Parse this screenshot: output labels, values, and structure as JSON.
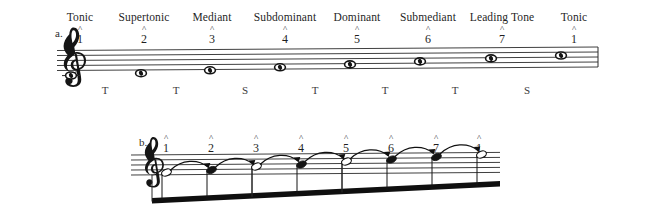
{
  "figure": {
    "ink_color": "#1a1a1a",
    "paper_color": "#ffffff"
  },
  "systems": [
    {
      "id": "a",
      "label": "a.",
      "clef": "treble-clef",
      "note_shape": "whole-note",
      "function_names": [
        "Tonic",
        "Supertonic",
        "Mediant",
        "Subdominant",
        "Dominant",
        "Submediant",
        "Leading Tone",
        "Tonic"
      ],
      "scale_degrees": [
        "1",
        "2",
        "3",
        "4",
        "5",
        "6",
        "7",
        "1"
      ],
      "caret": "^",
      "intervals": [
        "T",
        "T",
        "S",
        "T",
        "T",
        "T",
        "S"
      ],
      "interval_legend": {
        "T": "tone",
        "S": "semitone"
      }
    },
    {
      "id": "b",
      "label": "b.",
      "clef": "treble-clef",
      "scale_degrees": [
        "1",
        "2",
        "3",
        "4",
        "5",
        "6",
        "7",
        "1"
      ],
      "caret": "^",
      "notehead_styles": [
        "open",
        "filled",
        "open",
        "filled",
        "open",
        "filled",
        "filled",
        "open"
      ],
      "connector": "curved-arrow",
      "connector_count": 7,
      "beam": "single-thick-beam",
      "barline_count": 3
    }
  ]
}
